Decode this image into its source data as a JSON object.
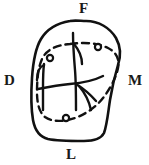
{
  "figure": {
    "kind": "dental-occlusal-diagram",
    "stroke_color": "#111111",
    "background_color": "#ffffff"
  },
  "labels": {
    "facial": "F",
    "distal": "D",
    "mesial": "M",
    "lingual": "L"
  },
  "outline": {
    "name": "tooth-crown-outline",
    "style": "solid",
    "stroke_width": 2.6
  },
  "preparation": {
    "name": "dashed-preparation-outline",
    "style": "dashed",
    "stroke_width": 2.4,
    "dash_pattern": "7 5",
    "marker_count": 3,
    "markers": [
      {
        "name": "marker-upper-left",
        "cx": 50,
        "cy": 58,
        "r": 3.1
      },
      {
        "name": "marker-upper-right",
        "cx": 98,
        "cy": 47,
        "r": 3.1
      },
      {
        "name": "marker-lower",
        "cx": 66,
        "cy": 118,
        "r": 3.1
      }
    ]
  },
  "fissures": {
    "name": "occlusal-groove-lines",
    "style": "solid",
    "stroke_width": 2.4,
    "count": 6
  }
}
